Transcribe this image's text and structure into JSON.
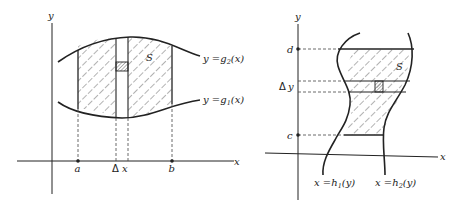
{
  "colors": {
    "ink": "#222222",
    "background": "#ffffff",
    "hatch": "#555555"
  },
  "left_diagram": {
    "axis_x_label": "x",
    "axis_y_label": "y",
    "region_label": "S",
    "upper_curve": {
      "lhs": "y =",
      "func": "g",
      "sub": "2",
      "arg": "(x)"
    },
    "lower_curve": {
      "lhs": "y =",
      "func": "g",
      "sub": "1",
      "arg": "(x)"
    },
    "tick_a": "a",
    "tick_b": "b",
    "strip_label_delta": "Δ",
    "strip_label_var": "x"
  },
  "right_diagram": {
    "axis_x_label": "x",
    "axis_y_label": "y",
    "region_label": "S",
    "tick_d": "d",
    "tick_c": "c",
    "strip_label_delta": "Δ",
    "strip_label_var": "y",
    "left_curve": {
      "lhs": "x =",
      "func": "h",
      "sub": "1",
      "arg": "(y)"
    },
    "right_curve": {
      "lhs": "x =",
      "func": "h",
      "sub": "2",
      "arg": "(y)"
    }
  }
}
